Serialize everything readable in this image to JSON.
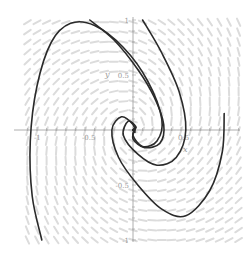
{
  "chart_data": {
    "type": "line",
    "subtype": "phase-portrait",
    "title": "",
    "xlabel": "x",
    "ylabel": "y",
    "xlim": [
      -1.1,
      1.1
    ],
    "ylim": [
      -1.05,
      1.0
    ],
    "x_ticks": [
      {
        "value": -1,
        "label": "-1"
      },
      {
        "value": -0.5,
        "label": "-0.5"
      },
      {
        "value": 0.5,
        "label": "0.5"
      }
    ],
    "y_ticks": [
      {
        "value": 1,
        "label": "1"
      },
      {
        "value": 0.5,
        "label": "0.5"
      },
      {
        "value": -0.5,
        "label": "-0.5"
      },
      {
        "value": -1,
        "label": "-1"
      }
    ],
    "grid": false,
    "legend": null,
    "direction_field": {
      "visible": true,
      "color": "#dcdcdc",
      "rotation": "clockwise spiral inward"
    },
    "trajectory_color": "#2a2a2a",
    "series": [
      {
        "name": "trajectory-1",
        "start": [
          -0.95,
          -1.0
        ],
        "description": "enters bottom-left, sweeps up to top-left near (-0.7,0.97), spirals inward to origin",
        "points": [
          [
            -0.95,
            -1.0
          ],
          [
            -1.05,
            -0.6
          ],
          [
            -1.07,
            -0.1
          ],
          [
            -1.0,
            0.4
          ],
          [
            -0.85,
            0.8
          ],
          [
            -0.65,
            0.97
          ],
          [
            -0.4,
            0.95
          ],
          [
            -0.1,
            0.75
          ],
          [
            0.15,
            0.45
          ],
          [
            0.3,
            0.1
          ],
          [
            0.25,
            -0.1
          ],
          [
            0.1,
            -0.15
          ],
          [
            0.0,
            -0.05
          ],
          [
            0.03,
            0.02
          ],
          [
            0.0,
            0.0
          ]
        ]
      },
      {
        "name": "trajectory-2",
        "start": [
          -0.45,
          1.0
        ],
        "description": "from top near x=-0.45, parallel to trajectory-1, spirals to origin",
        "points": [
          [
            -0.45,
            1.0
          ],
          [
            -0.2,
            0.82
          ],
          [
            0.05,
            0.55
          ],
          [
            0.22,
            0.3
          ],
          [
            0.32,
            0.05
          ],
          [
            0.28,
            -0.12
          ],
          [
            0.12,
            -0.16
          ],
          [
            0.0,
            -0.08
          ],
          [
            0.02,
            0.01
          ],
          [
            0.0,
            0.0
          ]
        ]
      },
      {
        "name": "trajectory-3",
        "start": [
          0.1,
          1.0
        ],
        "description": "from top near x=0.1, curves down through (0.55,0), spirals inward",
        "points": [
          [
            0.1,
            1.0
          ],
          [
            0.3,
            0.7
          ],
          [
            0.48,
            0.35
          ],
          [
            0.55,
            0.0
          ],
          [
            0.45,
            -0.25
          ],
          [
            0.25,
            -0.32
          ],
          [
            0.05,
            -0.22
          ],
          [
            -0.1,
            -0.05
          ],
          [
            -0.05,
            0.08
          ],
          [
            0.03,
            0.03
          ],
          [
            0.0,
            0.0
          ]
        ]
      },
      {
        "name": "trajectory-4",
        "start": [
          0.95,
          0.15
        ],
        "description": "from right near (0.95,0.15), sweeps down to (0.5,-0.78), back up left and spirals inward",
        "points": [
          [
            0.95,
            0.15
          ],
          [
            0.93,
            -0.2
          ],
          [
            0.8,
            -0.55
          ],
          [
            0.55,
            -0.78
          ],
          [
            0.3,
            -0.72
          ],
          [
            0.05,
            -0.5
          ],
          [
            -0.15,
            -0.25
          ],
          [
            -0.22,
            0.0
          ],
          [
            -0.12,
            0.12
          ],
          [
            0.0,
            0.05
          ],
          [
            0.02,
            -0.02
          ],
          [
            0.0,
            0.0
          ]
        ]
      }
    ]
  }
}
